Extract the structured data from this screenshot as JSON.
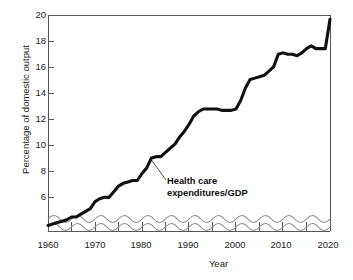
{
  "chart_data": {
    "type": "line",
    "title": "",
    "xlabel": "Year",
    "ylabel": "Percentage of domestic output",
    "xlim": [
      1960,
      2020
    ],
    "ylim": [
      4.6,
      20
    ],
    "grid": false,
    "legend": "none",
    "axis_break": "wavy-break-below-5-percent",
    "yticks": [
      "6",
      "8",
      "10",
      "12",
      "14",
      "16",
      "18",
      "20"
    ],
    "ytick_values": [
      6,
      8,
      10,
      12,
      14,
      16,
      18,
      20
    ],
    "xticks": [
      "1960",
      "1970",
      "1980",
      "1990",
      "2000",
      "2010",
      "2020"
    ],
    "xtick_values": [
      1960,
      1970,
      1980,
      1990,
      2000,
      2010,
      2020
    ],
    "xminor_values": [
      1965,
      1975,
      1985,
      1995,
      2005,
      2015
    ],
    "annotations": [
      {
        "text_line1": "Health care",
        "text_line2": "expenditures/GDP",
        "points_to_year": 1982,
        "points_to_value": 9.6
      }
    ],
    "series": [
      {
        "name": "Health care expenditures/GDP",
        "color": "#111111",
        "x": [
          1960,
          1961,
          1962,
          1963,
          1964,
          1965,
          1966,
          1967,
          1968,
          1969,
          1970,
          1971,
          1972,
          1973,
          1974,
          1975,
          1976,
          1977,
          1978,
          1979,
          1980,
          1981,
          1982,
          1983,
          1984,
          1985,
          1986,
          1987,
          1988,
          1989,
          1990,
          1991,
          1992,
          1993,
          1994,
          1995,
          1996,
          1997,
          1998,
          1999,
          2000,
          2001,
          2002,
          2003,
          2004,
          2005,
          2006,
          2007,
          2008,
          2009,
          2010,
          2011,
          2012,
          2013,
          2014,
          2015,
          2016,
          2017,
          2018,
          2019,
          2020
        ],
        "values": [
          5.0,
          5.1,
          5.2,
          5.3,
          5.4,
          5.6,
          5.6,
          5.8,
          6.0,
          6.2,
          6.7,
          6.9,
          7.0,
          7.0,
          7.4,
          7.8,
          8.0,
          8.1,
          8.2,
          8.2,
          8.7,
          9.1,
          9.8,
          9.9,
          9.9,
          10.2,
          10.5,
          10.8,
          11.3,
          11.7,
          12.2,
          12.8,
          13.1,
          13.3,
          13.3,
          13.3,
          13.3,
          13.2,
          13.2,
          13.2,
          13.3,
          13.9,
          14.8,
          15.4,
          15.5,
          15.6,
          15.7,
          16.0,
          16.3,
          17.2,
          17.3,
          17.2,
          17.2,
          17.1,
          17.3,
          17.6,
          17.8,
          17.6,
          17.6,
          17.6,
          19.7
        ]
      }
    ]
  },
  "axis": {
    "ylabel": "Percentage of domestic output",
    "xlabel": "Year"
  },
  "annotation": {
    "line1": "Health care",
    "line2": "expenditures/GDP"
  },
  "colors": {
    "line": "#111111",
    "frame": "#555555",
    "text": "#1a1a1a"
  }
}
